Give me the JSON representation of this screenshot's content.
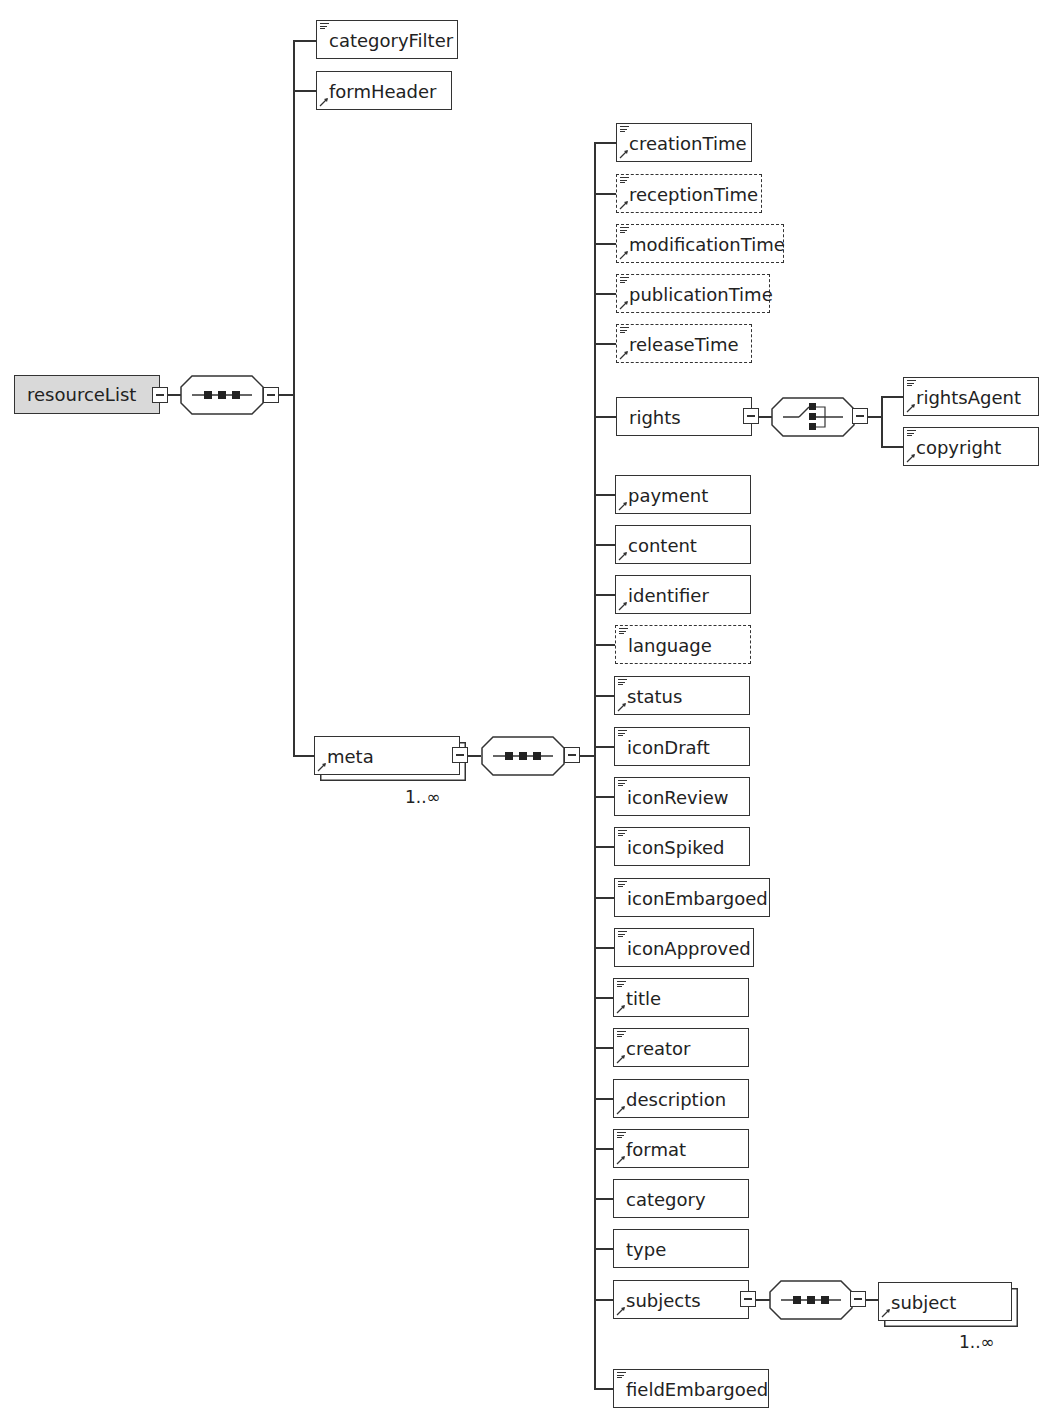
{
  "diagram": {
    "root": {
      "name": "resourceList",
      "compositor": "sequence"
    },
    "level1": [
      {
        "name": "categoryFilter",
        "documented": true,
        "reference": false,
        "optional": false
      },
      {
        "name": "formHeader",
        "documented": false,
        "reference": true,
        "optional": false
      },
      {
        "name": "meta",
        "documented": false,
        "reference": true,
        "optional": false,
        "occurrence": "1..∞",
        "compositor": "sequence"
      }
    ],
    "meta_children": [
      {
        "name": "creationTime",
        "documented": true,
        "reference": true,
        "optional": false
      },
      {
        "name": "receptionTime",
        "documented": true,
        "reference": true,
        "optional": true
      },
      {
        "name": "modificationTime",
        "documented": true,
        "reference": true,
        "optional": true
      },
      {
        "name": "publicationTime",
        "documented": true,
        "reference": true,
        "optional": true
      },
      {
        "name": "releaseTime",
        "documented": true,
        "reference": true,
        "optional": true
      },
      {
        "name": "rights",
        "documented": false,
        "reference": false,
        "optional": false,
        "compositor": "choice"
      },
      {
        "name": "payment",
        "documented": false,
        "reference": true,
        "optional": false
      },
      {
        "name": "content",
        "documented": false,
        "reference": true,
        "optional": false
      },
      {
        "name": "identifier",
        "documented": false,
        "reference": true,
        "optional": false
      },
      {
        "name": "language",
        "documented": true,
        "reference": false,
        "optional": true
      },
      {
        "name": "status",
        "documented": true,
        "reference": true,
        "optional": false
      },
      {
        "name": "iconDraft",
        "documented": true,
        "reference": false,
        "optional": false
      },
      {
        "name": "iconReview",
        "documented": true,
        "reference": false,
        "optional": false
      },
      {
        "name": "iconSpiked",
        "documented": true,
        "reference": false,
        "optional": false
      },
      {
        "name": "iconEmbargoed",
        "documented": true,
        "reference": false,
        "optional": false
      },
      {
        "name": "iconApproved",
        "documented": true,
        "reference": false,
        "optional": false
      },
      {
        "name": "title",
        "documented": true,
        "reference": true,
        "optional": false
      },
      {
        "name": "creator",
        "documented": true,
        "reference": true,
        "optional": false
      },
      {
        "name": "description",
        "documented": false,
        "reference": true,
        "optional": false
      },
      {
        "name": "format",
        "documented": true,
        "reference": true,
        "optional": false
      },
      {
        "name": "category",
        "documented": false,
        "reference": false,
        "optional": false
      },
      {
        "name": "type",
        "documented": false,
        "reference": false,
        "optional": false
      },
      {
        "name": "subjects",
        "documented": false,
        "reference": true,
        "optional": false,
        "compositor": "sequence"
      },
      {
        "name": "fieldEmbargoed",
        "documented": true,
        "reference": false,
        "optional": false
      }
    ],
    "rights_children": [
      {
        "name": "rightsAgent",
        "documented": true,
        "reference": true
      },
      {
        "name": "copyright",
        "documented": true,
        "reference": true
      }
    ],
    "subjects_children": [
      {
        "name": "subject",
        "documented": false,
        "reference": true,
        "occurrence": "1..∞"
      }
    ]
  }
}
